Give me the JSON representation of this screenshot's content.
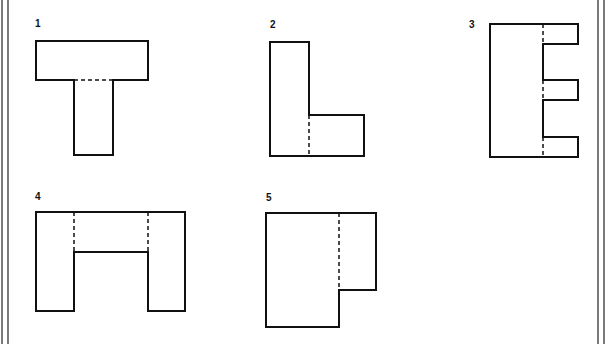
{
  "figure": {
    "colors": {
      "ink": "#111111",
      "background": "#ffffff",
      "border": "#222222"
    },
    "shapes": [
      {
        "id": "1",
        "label": "1",
        "label_pos": [
          35,
          27
        ],
        "outline": "36,41 148,41 148,80 113,80 113,155 74,155 74,80 36,80",
        "hidden_lines": [
          [
            74,
            80,
            113,
            80
          ]
        ]
      },
      {
        "id": "2",
        "label": "2",
        "label_pos": [
          270,
          28
        ],
        "outline": "270,42 309,42 309,115 364,115 364,156 270,156",
        "hidden_lines": [
          [
            309,
            115,
            309,
            156
          ]
        ]
      },
      {
        "id": "3",
        "label": "3",
        "label_pos": [
          469,
          28
        ],
        "outline": "490,24 578,24 578,44 543,44 543,80 578,80 578,100 543,100 543,137 578,137 578,157 490,157",
        "hidden_lines": [
          [
            543,
            24,
            543,
            44
          ],
          [
            543,
            80,
            543,
            100
          ],
          [
            543,
            137,
            543,
            157
          ]
        ]
      },
      {
        "id": "4",
        "label": "4",
        "label_pos": [
          35,
          200
        ],
        "outline": "36,212 185,212 185,311 148,311 148,252 74,252 74,311 36,311",
        "hidden_lines": [
          [
            74,
            212,
            74,
            252
          ],
          [
            148,
            212,
            148,
            252
          ]
        ]
      },
      {
        "id": "5",
        "label": "5",
        "label_pos": [
          266,
          201
        ],
        "outline": "266,213 376,213 376,290 339,290 339,327 266,327",
        "hidden_lines": [
          [
            339,
            213,
            339,
            290
          ]
        ]
      }
    ],
    "borders": {
      "left": [
        2,
        8
      ],
      "right": [
        598,
        604
      ]
    }
  }
}
